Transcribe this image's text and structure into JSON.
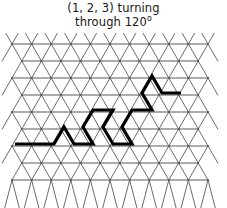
{
  "figure": {
    "title_line1": "(1, 2, 3) turning",
    "title_line2": "through 120",
    "degree_symbol": "o",
    "background_color": "#ffffff",
    "grid_color": "#5a5a5a",
    "path_color": "#000000"
  },
  "chart_data": {
    "type": "diagram",
    "subtitle": "",
    "lattice": {
      "kind": "triangular",
      "x_min": 12,
      "x_max": 214,
      "y_min": 44,
      "y_max": 196,
      "node_spacing_x": 19.6,
      "row_spacing_y": 17.0,
      "row_offset_x": 9.8,
      "line_width": 0.9,
      "grid": true
    },
    "path": {
      "label": "(1, 2, 3) turn sequence",
      "turn_angle_deg": 120,
      "turn_sequence": [
        1,
        2,
        3
      ],
      "line_width": 3.2,
      "closed": false,
      "points": [
        [
          15.0,
          144.0
        ],
        [
          54.0,
          144.0
        ],
        [
          64.0,
          127.0
        ],
        [
          74.0,
          144.0
        ],
        [
          93.0,
          144.0
        ],
        [
          83.0,
          127.0
        ],
        [
          93.0,
          110.0
        ],
        [
          113.0,
          110.0
        ],
        [
          103.0,
          127.0
        ],
        [
          113.0,
          144.0
        ],
        [
          132.0,
          144.0
        ],
        [
          122.0,
          127.0
        ],
        [
          132.0,
          110.0
        ],
        [
          152.0,
          110.0
        ],
        [
          142.0,
          93.0
        ],
        [
          152.0,
          76.0
        ],
        [
          162.0,
          93.0
        ],
        [
          181.0,
          93.0
        ]
      ]
    },
    "xlabel": "",
    "ylabel": "",
    "legend": []
  }
}
